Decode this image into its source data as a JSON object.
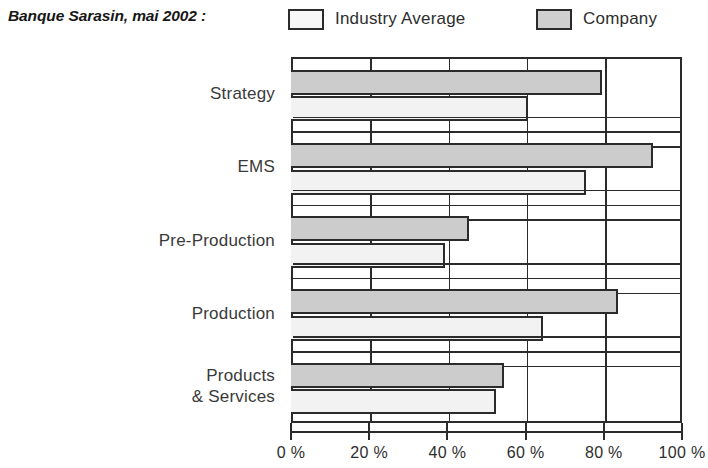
{
  "header": {
    "title": "Banque Sarasin, mai 2002 :",
    "legend": [
      {
        "label": "Industry Average",
        "swatch": "white-swatch",
        "color": "#f7f7f7"
      },
      {
        "label": "Company",
        "swatch": "gray-swatch",
        "color": "#cfcfcf"
      }
    ]
  },
  "axis": {
    "ticks": [
      "0 %",
      "20 %",
      "40 %",
      "60 %",
      "80 %",
      "100 %"
    ],
    "tick_values": [
      0,
      20,
      40,
      60,
      80,
      100
    ]
  },
  "categories": [
    {
      "label": "Strategy"
    },
    {
      "label": "EMS"
    },
    {
      "label": "Pre-Production"
    },
    {
      "label": "Production"
    },
    {
      "label": "Products\n& Services"
    }
  ],
  "chart_data": {
    "type": "bar",
    "orientation": "horizontal",
    "title": "Banque Sarasin, mai 2002 :",
    "xlabel": "",
    "ylabel": "",
    "xlim": [
      0,
      100
    ],
    "xticks": [
      0,
      20,
      40,
      60,
      80,
      100
    ],
    "xtick_labels": [
      "0 %",
      "20 %",
      "40 %",
      "60 %",
      "80 %",
      "100 %"
    ],
    "grid": true,
    "grid_axis": "x",
    "legend_position": "top",
    "categories": [
      "Strategy",
      "EMS",
      "Pre-Production",
      "Production",
      "Products & Services"
    ],
    "series": [
      {
        "name": "Company",
        "color": "#cccccc",
        "values": [
          79,
          92,
          45,
          83,
          54
        ]
      },
      {
        "name": "Industry Average",
        "color": "#f2f2f2",
        "values": [
          60,
          75,
          39,
          64,
          52
        ]
      }
    ]
  }
}
